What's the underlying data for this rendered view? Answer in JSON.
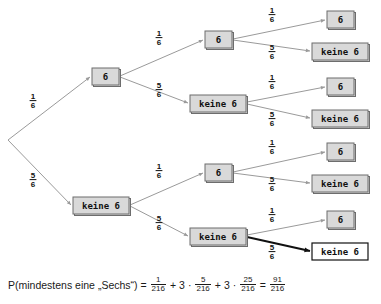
{
  "diagram": {
    "type": "probability-tree",
    "labels": {
      "six": "6",
      "not_six": "keine 6"
    },
    "probabilities": {
      "six": {
        "num": "1",
        "den": "6"
      },
      "not_six": {
        "num": "5",
        "den": "6"
      }
    },
    "root": {
      "x": 8,
      "y": 140
    },
    "levels": [
      {
        "level": 1,
        "nodes": [
          {
            "id": "n-6",
            "label": "6",
            "kind": "six",
            "x": 92,
            "y": 68,
            "w": 27,
            "h": 17,
            "cx": 105.5,
            "cy": 76.5,
            "white": false
          },
          {
            "id": "n-k6",
            "label": "keine 6",
            "kind": "not_six",
            "x": 73,
            "y": 197,
            "w": 56,
            "h": 17,
            "cx": 101,
            "cy": 205.5,
            "white": false
          }
        ]
      },
      {
        "level": 2,
        "nodes": [
          {
            "id": "n-6-6",
            "label": "6",
            "kind": "six",
            "x": 205,
            "y": 31,
            "w": 27,
            "h": 17,
            "cx": 218.5,
            "cy": 39.5,
            "white": false
          },
          {
            "id": "n-6-k6",
            "label": "keine 6",
            "kind": "not_six",
            "x": 190,
            "y": 95,
            "w": 56,
            "h": 17,
            "cx": 218,
            "cy": 103.5,
            "white": false
          },
          {
            "id": "n-k6-6",
            "label": "6",
            "kind": "six",
            "x": 205,
            "y": 164,
            "w": 27,
            "h": 17,
            "cx": 218.5,
            "cy": 172.5,
            "white": false
          },
          {
            "id": "n-k6-k6",
            "label": "keine 6",
            "kind": "not_six",
            "x": 190,
            "y": 228,
            "w": 56,
            "h": 17,
            "cx": 218,
            "cy": 236.5,
            "white": false
          }
        ]
      },
      {
        "level": 3,
        "nodes": [
          {
            "id": "l-1",
            "label": "6",
            "kind": "six",
            "x": 327,
            "y": 11,
            "w": 27,
            "h": 17,
            "cx": 340.5,
            "cy": 19.5,
            "white": false
          },
          {
            "id": "l-2",
            "label": "keine 6",
            "kind": "not_six",
            "x": 312,
            "y": 43,
            "w": 56,
            "h": 17,
            "cx": 340,
            "cy": 51.5,
            "white": false
          },
          {
            "id": "l-3",
            "label": "6",
            "kind": "six",
            "x": 327,
            "y": 78,
            "w": 27,
            "h": 17,
            "cx": 340.5,
            "cy": 86.5,
            "white": false
          },
          {
            "id": "l-4",
            "label": "keine 6",
            "kind": "not_six",
            "x": 312,
            "y": 110,
            "w": 56,
            "h": 17,
            "cx": 340,
            "cy": 118.5,
            "white": false
          },
          {
            "id": "l-5",
            "label": "6",
            "kind": "six",
            "x": 327,
            "y": 143,
            "w": 27,
            "h": 17,
            "cx": 340.5,
            "cy": 151.5,
            "white": false
          },
          {
            "id": "l-6",
            "label": "keine 6",
            "kind": "not_six",
            "x": 312,
            "y": 175,
            "w": 56,
            "h": 17,
            "cx": 340,
            "cy": 183.5,
            "white": false
          },
          {
            "id": "l-7",
            "label": "6",
            "kind": "six",
            "x": 327,
            "y": 211,
            "w": 27,
            "h": 17,
            "cx": 340.5,
            "cy": 219.5,
            "white": false
          },
          {
            "id": "l-8",
            "label": "keine 6",
            "kind": "not_six",
            "x": 312,
            "y": 243,
            "w": 56,
            "h": 17,
            "cx": 340,
            "cy": 251.5,
            "white": true
          }
        ]
      }
    ],
    "edges": [
      {
        "id": "e-root-6",
        "from": "root",
        "to": "n-6",
        "x1": 8,
        "y1": 140,
        "x2": 90,
        "y2": 77,
        "kind": "six",
        "lx": 33,
        "ly": 100,
        "highlight": false
      },
      {
        "id": "e-root-k6",
        "from": "root",
        "to": "n-k6",
        "x1": 8,
        "y1": 140,
        "x2": 71,
        "y2": 205,
        "kind": "not_six",
        "lx": 33,
        "ly": 179,
        "highlight": false
      },
      {
        "id": "e-6-6",
        "from": "n-6",
        "to": "n-6-6",
        "x1": 120,
        "y1": 76,
        "x2": 203,
        "y2": 40,
        "kind": "six",
        "lx": 159,
        "ly": 37,
        "highlight": false
      },
      {
        "id": "e-6-k6",
        "from": "n-6",
        "to": "n-6-k6",
        "x1": 120,
        "y1": 77,
        "x2": 188,
        "y2": 103,
        "kind": "not_six",
        "lx": 159,
        "ly": 89,
        "highlight": false
      },
      {
        "id": "e-k6-6",
        "from": "n-k6",
        "to": "n-k6-6",
        "x1": 130,
        "y1": 205,
        "x2": 203,
        "y2": 173,
        "kind": "six",
        "lx": 159,
        "ly": 170,
        "highlight": false
      },
      {
        "id": "e-k6-k6",
        "from": "n-k6",
        "to": "n-k6-k6",
        "x1": 130,
        "y1": 206,
        "x2": 188,
        "y2": 236,
        "kind": "not_six",
        "lx": 159,
        "ly": 222,
        "highlight": false
      },
      {
        "id": "e-66-6",
        "from": "n-6-6",
        "to": "l-1",
        "x1": 233,
        "y1": 39,
        "x2": 325,
        "y2": 20,
        "kind": "six",
        "lx": 272,
        "ly": 14,
        "highlight": false
      },
      {
        "id": "e-66-k6",
        "from": "n-6-6",
        "to": "l-2",
        "x1": 233,
        "y1": 40,
        "x2": 310,
        "y2": 51,
        "kind": "not_six",
        "lx": 272,
        "ly": 51,
        "highlight": false
      },
      {
        "id": "e-6k6-6",
        "from": "n-6-k6",
        "to": "l-3",
        "x1": 247,
        "y1": 102,
        "x2": 325,
        "y2": 87,
        "kind": "six",
        "lx": 272,
        "ly": 81,
        "highlight": false
      },
      {
        "id": "e-6k6-k6",
        "from": "n-6-k6",
        "to": "l-4",
        "x1": 247,
        "y1": 104,
        "x2": 310,
        "y2": 118,
        "kind": "not_six",
        "lx": 272,
        "ly": 118,
        "highlight": false
      },
      {
        "id": "e-k66-6",
        "from": "n-k6-6",
        "to": "l-5",
        "x1": 233,
        "y1": 172,
        "x2": 325,
        "y2": 152,
        "kind": "six",
        "lx": 272,
        "ly": 146,
        "highlight": false
      },
      {
        "id": "e-k66-k6",
        "from": "n-k6-6",
        "to": "l-6",
        "x1": 233,
        "y1": 173,
        "x2": 310,
        "y2": 183,
        "kind": "not_six",
        "lx": 272,
        "ly": 183,
        "highlight": false
      },
      {
        "id": "e-k6k6-6",
        "from": "n-k6-k6",
        "to": "l-7",
        "x1": 247,
        "y1": 235,
        "x2": 325,
        "y2": 220,
        "kind": "six",
        "lx": 272,
        "ly": 214,
        "highlight": false
      },
      {
        "id": "e-k6k6-k6",
        "from": "n-k6-k6",
        "to": "l-8",
        "x1": 247,
        "y1": 237,
        "x2": 310,
        "y2": 251,
        "kind": "not_six",
        "lx": 272,
        "ly": 251,
        "highlight": true
      }
    ]
  },
  "formula": {
    "lead": "P(mindestens eine „Sechs“) =",
    "terms": [
      {
        "coefficient": "",
        "num": "1",
        "den": "216",
        "operator": ""
      },
      {
        "coefficient": "3",
        "num": "5",
        "den": "216",
        "operator": "+"
      },
      {
        "coefficient": "3",
        "num": "25",
        "den": "216",
        "operator": "+"
      }
    ],
    "equals": "=",
    "result": {
      "num": "91",
      "den": "216"
    },
    "dot": "·",
    "plus": "+"
  }
}
